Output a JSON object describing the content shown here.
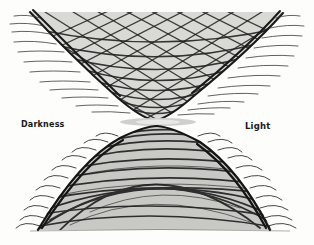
{
  "figure": {
    "type": "hand-drawn hourglass diagram",
    "labels": {
      "left": "Darkness",
      "right": "Light"
    },
    "colors": {
      "ink": "#1a1a1a",
      "background": "#fdfdfc"
    }
  }
}
